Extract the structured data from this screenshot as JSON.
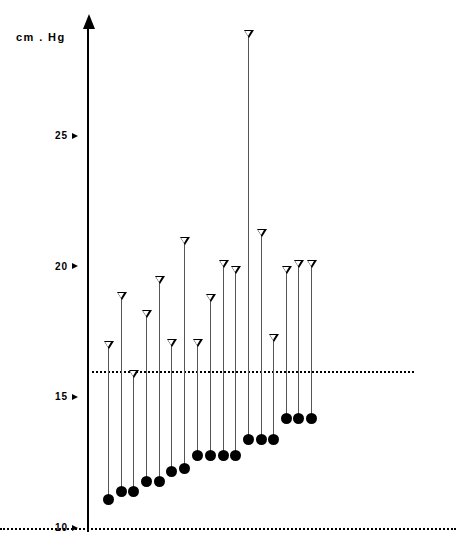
{
  "chart_data": {
    "type": "range",
    "title": "",
    "subtitle": "",
    "ylabel": "cm . Hg",
    "xlabel": "",
    "ylim": [
      9.2,
      29.8
    ],
    "yticks": [
      10,
      15,
      20,
      25
    ],
    "ytick_labels": [
      "10",
      "15",
      "20",
      "25"
    ],
    "grid": false,
    "legend": null,
    "annotations": [
      {
        "name": "upper-reference-line",
        "value": 16.0,
        "style": "dotted"
      },
      {
        "name": "lower-reference-line",
        "value": 10.0,
        "style": "dotted"
      }
    ],
    "series": [
      {
        "name": "upper-value",
        "marker": "open-down-triangle",
        "values": [
          17.1,
          19.0,
          16.0,
          18.3,
          19.6,
          17.2,
          21.1,
          17.2,
          18.9,
          20.2,
          20.0,
          29.0,
          21.4,
          17.4,
          20.0,
          20.2
        ]
      },
      {
        "name": "lower-value",
        "marker": "filled-circle",
        "values": [
          11.1,
          11.4,
          11.4,
          11.8,
          11.8,
          12.2,
          12.3,
          12.8,
          12.8,
          12.8,
          12.8,
          13.4,
          13.4,
          13.4,
          14.2,
          14.2,
          14.2
        ]
      }
    ],
    "points": [
      {
        "x": 108,
        "top": 17.1,
        "bottom": 11.1
      },
      {
        "x": 121,
        "top": 19.0,
        "bottom": 11.4
      },
      {
        "x": 133,
        "top": 16.0,
        "bottom": 11.4
      },
      {
        "x": 146,
        "top": 18.3,
        "bottom": 11.8
      },
      {
        "x": 159,
        "top": 19.6,
        "bottom": 11.8
      },
      {
        "x": 171,
        "top": 17.2,
        "bottom": 12.2
      },
      {
        "x": 184,
        "top": 21.1,
        "bottom": 12.3
      },
      {
        "x": 197,
        "top": 17.2,
        "bottom": 12.8
      },
      {
        "x": 210,
        "top": 18.9,
        "bottom": 12.8
      },
      {
        "x": 223,
        "top": 20.2,
        "bottom": 12.8
      },
      {
        "x": 235,
        "top": 20.0,
        "bottom": 12.8
      },
      {
        "x": 248,
        "top": 29.0,
        "bottom": 13.4
      },
      {
        "x": 261,
        "top": 21.4,
        "bottom": 13.4
      },
      {
        "x": 273,
        "top": 17.4,
        "bottom": 13.4
      },
      {
        "x": 286,
        "top": 20.0,
        "bottom": 14.2
      },
      {
        "x": 298,
        "top": 20.2,
        "bottom": 14.2
      },
      {
        "x": 311,
        "top": 20.2,
        "bottom": 14.2
      }
    ]
  },
  "axis": {
    "unit_label": "cm . Hg",
    "ticks": [
      {
        "label": "25",
        "value": 25
      },
      {
        "label": "20",
        "value": 20
      },
      {
        "label": "15",
        "value": 15
      },
      {
        "label": "10",
        "value": 10
      }
    ]
  },
  "colors": {
    "ink": "#000000",
    "stem": "#555555",
    "background": "#ffffff"
  }
}
